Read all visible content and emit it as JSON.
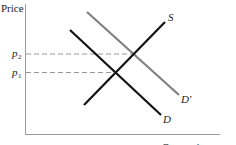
{
  "diagram": {
    "y_axis_label": "Price",
    "x_axis_label": "Quantity",
    "price_labels": {
      "p2": {
        "main": "p",
        "sub": "2"
      },
      "p1": {
        "main": "p",
        "sub": "1"
      }
    },
    "curves": [
      {
        "name": "S",
        "label": "S",
        "color": "#111111",
        "from": [
          84,
          105
        ],
        "to": [
          165,
          22
        ]
      },
      {
        "name": "D",
        "label": "D",
        "color": "#111111",
        "from": [
          70,
          30
        ],
        "to": [
          161,
          115
        ]
      },
      {
        "name": "D'",
        "label": "D′",
        "color": "#808080",
        "from": [
          87,
          12
        ],
        "to": [
          179,
          95
        ]
      }
    ],
    "equilibria": [
      {
        "name": "original",
        "curves": [
          "S",
          "D"
        ],
        "price": "p1"
      },
      {
        "name": "new",
        "curves": [
          "S",
          "D'"
        ],
        "price": "p2"
      }
    ],
    "colors": {
      "axis": "#9a9a9a",
      "dashed": "#999999",
      "supply": "#111111",
      "demand": "#111111",
      "demand_shifted": "#808080"
    }
  }
}
